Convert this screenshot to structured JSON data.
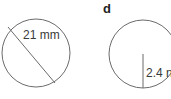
{
  "figures": [
    {
      "id": "c",
      "part_label": "",
      "measurement": "21 mm",
      "type": "diameter"
    },
    {
      "id": "d",
      "part_label": "d",
      "measurement": "2.4 n",
      "type": "radius"
    }
  ],
  "colors": {
    "stroke": "#6b6b6b",
    "text": "#3a3a3a"
  }
}
